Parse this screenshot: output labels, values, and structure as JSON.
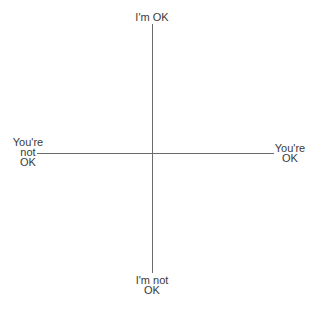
{
  "diagram": {
    "type": "quadrant",
    "colors": {
      "line": "#6b6b6b",
      "text": "#3a3a3a",
      "background": "#ffffff"
    },
    "labels": {
      "top": [
        "I'm OK"
      ],
      "bottom": [
        "I'm not",
        "OK"
      ],
      "left": [
        "You're",
        "not",
        "OK"
      ],
      "right": [
        "You're",
        "OK"
      ]
    }
  }
}
